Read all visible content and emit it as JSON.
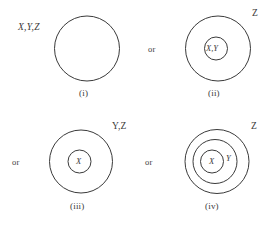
{
  "figure": {
    "name": "venn-style-nested-circle-diagram",
    "background_color": "#ffffff",
    "stroke_color": "#3a3a3a",
    "text_color": "#3b3a3a",
    "width": 277,
    "height": 226
  },
  "connectors": {
    "or_row1": "or",
    "or_row2_left": "or",
    "or_row2_right": "or"
  },
  "panels": [
    {
      "id": "i",
      "caption": "(i)",
      "outer_label": "X,Y,Z",
      "inner_labels": [],
      "circle_count": 1
    },
    {
      "id": "ii",
      "caption": "(ii)",
      "outer_label": "Z",
      "inner_labels": [
        "X,Y"
      ],
      "circle_count": 2
    },
    {
      "id": "iii",
      "caption": "(iii)",
      "outer_label": "Y,Z",
      "inner_labels": [
        "X"
      ],
      "circle_count": 2
    },
    {
      "id": "iv",
      "caption": "(iv)",
      "outer_label": "Z",
      "inner_labels": [
        "X",
        "Y"
      ],
      "circle_count": 3
    }
  ]
}
